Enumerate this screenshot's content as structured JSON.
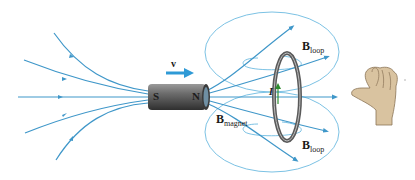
{
  "diagram": {
    "colors": {
      "field_line": "#3f97c9",
      "loop_field": "#7cc2e4",
      "magnet_body": "#5e5e5e",
      "loop_ring": "#6b6b6b",
      "hand": "#d9c3a0",
      "current_arrow": "#2e8b2e",
      "velocity_arrow": "#2f9ad6"
    },
    "magnet": {
      "south_label": "S",
      "north_label": "N"
    },
    "velocity": {
      "label": "v"
    },
    "current": {
      "label": "I"
    },
    "labels": {
      "b_magnet_main": "B",
      "b_magnet_sub": "magnet",
      "b_loop_top_main": "B",
      "b_loop_top_sub": "loop",
      "b_loop_bottom_main": "B",
      "b_loop_bottom_sub": "loop"
    }
  }
}
